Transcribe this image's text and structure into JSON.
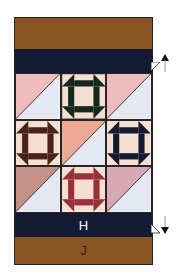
{
  "diagram": {
    "type": "quilt-layout",
    "bands": {
      "top_outer": {
        "label": "",
        "color": "#8a5524"
      },
      "top_inner": {
        "label": "",
        "color": "#141a33"
      },
      "bottom_inner": {
        "label": "H",
        "color": "#141a33"
      },
      "bottom_outer": {
        "label": "J",
        "color": "#8a5524"
      }
    },
    "grid": {
      "rows": 3,
      "cols": 3,
      "blocks": [
        {
          "type": "half-square-triangle",
          "upper_color": "#efbcbc",
          "lower_color": "#e4e8f2"
        },
        {
          "type": "churn-dash",
          "accent_color": "#16281c",
          "center_color": "#f5dfd3"
        },
        {
          "type": "half-square-triangle",
          "upper_color": "#efbcbc",
          "lower_color": "#e4e8f2"
        },
        {
          "type": "churn-dash",
          "accent_color": "#4a2318",
          "center_color": "#f5dfd3"
        },
        {
          "type": "half-square-triangle",
          "upper_color": "#eda992",
          "lower_color": "#e4e8f2"
        },
        {
          "type": "churn-dash",
          "accent_color": "#141a2e",
          "center_color": "#f5dfd3"
        },
        {
          "type": "half-square-triangle",
          "upper_color": "#c49186",
          "lower_color": "#e4e8f2"
        },
        {
          "type": "churn-dash",
          "accent_color": "#9a3038",
          "center_color": "#f5dfd3"
        },
        {
          "type": "half-square-triangle",
          "upper_color": "#d7a8b6",
          "lower_color": "#e4e8f2"
        }
      ]
    },
    "arrows": [
      {
        "direction": "up",
        "position": "top-inner-band-right"
      },
      {
        "direction": "down",
        "position": "bottom-inner-band-right"
      }
    ]
  }
}
